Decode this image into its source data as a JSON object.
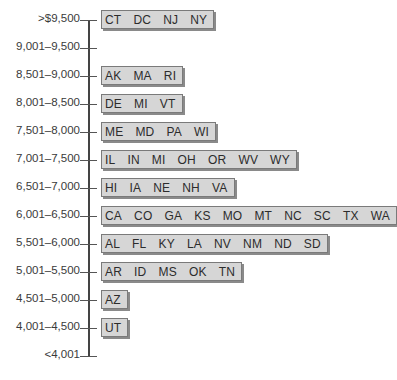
{
  "chart_data": {
    "type": "table",
    "title": "",
    "xlabel": "",
    "ylabel": "",
    "orientation": "vertical-axis-with-grouped-boxes",
    "categories": [
      ">$9,500",
      "9,001–9,500",
      "8,501–9,000",
      "8,001–8,500",
      "7,501–8,000",
      "7,001–7,500",
      "6,501–7,000",
      "6,001–6,500",
      "5,501–6,000",
      "5,001–5,500",
      "4,501–5,000",
      "4,001–4,500",
      "<4,001"
    ],
    "groups": [
      {
        "range": ">$9,500",
        "states": [
          "CT",
          "DC",
          "NJ",
          "NY"
        ],
        "count": 4
      },
      {
        "range": "9,001–9,500",
        "states": [],
        "count": 0
      },
      {
        "range": "8,501–9,000",
        "states": [
          "AK",
          "MA",
          "RI"
        ],
        "count": 3
      },
      {
        "range": "8,001–8,500",
        "states": [
          "DE",
          "MI",
          "VT"
        ],
        "count": 3
      },
      {
        "range": "7,501–8,000",
        "states": [
          "ME",
          "MD",
          "PA",
          "WI"
        ],
        "count": 4
      },
      {
        "range": "7,001–7,500",
        "states": [
          "IL",
          "IN",
          "MI",
          "OH",
          "OR",
          "WV",
          "WY"
        ],
        "count": 7
      },
      {
        "range": "6,501–7,000",
        "states": [
          "HI",
          "IA",
          "NE",
          "NH",
          "VA"
        ],
        "count": 5
      },
      {
        "range": "6,001–6,500",
        "states": [
          "CA",
          "CO",
          "GA",
          "KS",
          "MO",
          "MT",
          "NC",
          "SC",
          "TX",
          "WA"
        ],
        "count": 10
      },
      {
        "range": "5,501–6,000",
        "states": [
          "AL",
          "FL",
          "KY",
          "LA",
          "NV",
          "NM",
          "ND",
          "SD"
        ],
        "count": 8
      },
      {
        "range": "5,001–5,500",
        "states": [
          "AR",
          "ID",
          "MS",
          "OK",
          "TN"
        ],
        "count": 5
      },
      {
        "range": "4,501–5,000",
        "states": [
          "AZ"
        ],
        "count": 1
      },
      {
        "range": "4,001–4,500",
        "states": [
          "UT"
        ],
        "count": 1
      },
      {
        "range": "<4,001",
        "states": [],
        "count": 0
      }
    ],
    "values": [
      4,
      0,
      3,
      3,
      4,
      7,
      5,
      10,
      8,
      5,
      1,
      1,
      0
    ],
    "legend": [],
    "grid": false
  },
  "colors": {
    "box_fill": "#d6d6d6",
    "box_border": "#7a7a7a",
    "box_shadow": "#8a8a8a",
    "axis": "#444444",
    "text": "#333333"
  }
}
